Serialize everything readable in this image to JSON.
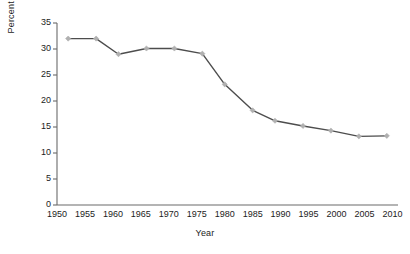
{
  "chart_data": {
    "type": "line",
    "title": "",
    "xlabel": "Year",
    "ylabel": "Percent Unionized",
    "xlim": [
      1950,
      2011
    ],
    "ylim": [
      0,
      35
    ],
    "grid": false,
    "legend": null,
    "x_ticks": [
      1950,
      1955,
      1960,
      1965,
      1970,
      1975,
      1980,
      1985,
      1990,
      1995,
      2000,
      2005,
      2010
    ],
    "x_tick_labels": [
      "1950",
      "1955",
      "1960",
      "1965",
      "1970",
      "1975",
      "1980",
      "1985",
      "1990",
      "1995",
      "2000",
      "2005",
      "2010"
    ],
    "y_ticks": [
      0,
      5,
      10,
      15,
      20,
      25,
      30,
      35
    ],
    "y_tick_labels": [
      "0",
      "5",
      "10",
      "15",
      "20",
      "25",
      "30",
      "35"
    ],
    "series": [
      {
        "name": "Percent Unionized",
        "line_color": "#4d4d4d",
        "marker": "diamond",
        "marker_color": "#b0b0b0",
        "x": [
          1952,
          1957,
          1961,
          1966,
          1971,
          1976,
          1980,
          1985,
          1989,
          1994,
          1999,
          2004,
          2009
        ],
        "values": [
          32.0,
          32.0,
          29.0,
          30.1,
          30.1,
          29.1,
          23.2,
          18.2,
          16.2,
          15.2,
          14.3,
          13.2,
          13.3
        ]
      }
    ]
  },
  "colors": {
    "axis": "#6b6b6b",
    "text": "#1c1c1c",
    "line": "#4d4d4d",
    "marker": "#b0b0b0",
    "background": "#ffffff"
  }
}
